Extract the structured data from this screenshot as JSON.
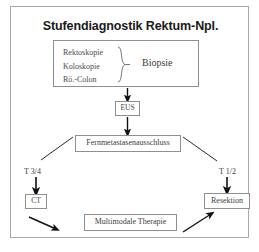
{
  "diagram": {
    "title": "Stufendiagnostik Rektum-Npl.",
    "workup_box": {
      "items": [
        "Rektoskopie",
        "Koloskopie",
        "Rö.-Colon"
      ],
      "brace_glyph": "}",
      "result_label": "Biopsie"
    },
    "nodes": {
      "eus": "EUS",
      "fernmetastasen": "Fernmetastasenausschluss",
      "ct": "CT",
      "resektion": "Resektion",
      "multimodal": "Multimodale Therapie"
    },
    "branch_labels": {
      "left": "T 3/4",
      "right": "T 1/2"
    },
    "colors": {
      "frame_border": "#a8a8a8",
      "box_border": "#8f8f8f",
      "text": "#3d3d3d",
      "title": "#1a1a1a",
      "arrow": "#111111",
      "background": "#ffffff"
    }
  }
}
